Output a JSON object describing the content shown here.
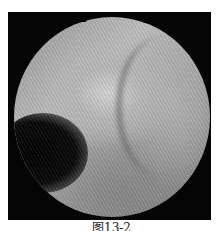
{
  "figure": {
    "caption": "图13-2",
    "image": {
      "description": "grayscale endoscopic view in circular field on black background",
      "background_color": "#050505",
      "tone_light": "#d8d8d8",
      "tone_dark": "#020202"
    }
  }
}
